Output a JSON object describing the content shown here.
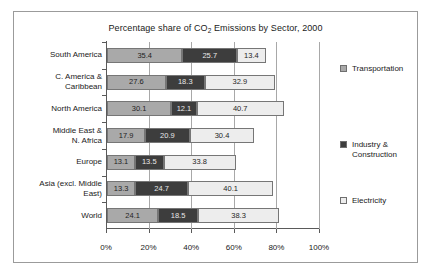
{
  "chart_data": {
    "type": "bar",
    "orientation": "horizontal",
    "stacked": true,
    "title": "Percentage share of CO2 Emissions by Sector, 2000",
    "title_prefix": "Percentage share of CO",
    "title_subscript": "2",
    "title_suffix": " Emissions by Sector, 2000",
    "xlabel": "",
    "ylabel": "",
    "xlim": [
      0,
      100
    ],
    "grid": true,
    "grid_axis": "x",
    "legend_position": "right",
    "categories": [
      "South America",
      "C. America &\nCaribbean",
      "North America",
      "Middle East &\nN. Africa",
      "Europe",
      "Asia (excl. Middle\nEast)",
      "World"
    ],
    "series": [
      {
        "name": "Transportation",
        "color": "#a9a9a9",
        "values": [
          35.4,
          27.6,
          30.1,
          17.9,
          13.1,
          13.3,
          24.1
        ]
      },
      {
        "name": "Industry & Construction",
        "color": "#3d3d3d",
        "values": [
          25.7,
          18.3,
          12.1,
          20.9,
          13.5,
          24.7,
          18.5
        ]
      },
      {
        "name": "Electricity",
        "color": "#ededed",
        "values": [
          13.4,
          32.9,
          40.7,
          30.4,
          33.8,
          40.1,
          38.3
        ]
      }
    ],
    "xticks": [
      0,
      20,
      40,
      60,
      80,
      100
    ],
    "xtick_labels": [
      "0%",
      "20%",
      "40%",
      "60%",
      "80%",
      "100%"
    ],
    "legend": [
      {
        "label": "Transportation",
        "color": "#a9a9a9"
      },
      {
        "label": "Industry &\nConstruction",
        "color": "#3d3d3d"
      },
      {
        "label": "Electricity",
        "color": "#ededed"
      }
    ]
  }
}
